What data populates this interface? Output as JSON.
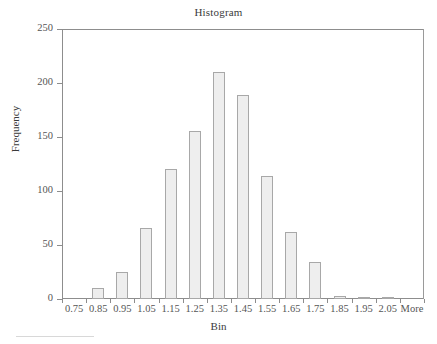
{
  "chart_data": {
    "type": "bar",
    "title": "Histogram",
    "subtitle": "",
    "xlabel": "Bin",
    "ylabel": "Frequency",
    "categories": [
      "0.75",
      "0.85",
      "0.95",
      "1.05",
      "1.15",
      "1.25",
      "1.35",
      "1.45",
      "1.55",
      "1.65",
      "1.75",
      "1.85",
      "1.95",
      "2.05",
      "More"
    ],
    "values": [
      0,
      10,
      25,
      66,
      120,
      156,
      210,
      189,
      114,
      62,
      34,
      3,
      1,
      1,
      0
    ],
    "series": [
      {
        "name": "Frequency",
        "values": [
          0,
          10,
          25,
          66,
          120,
          156,
          210,
          189,
          114,
          62,
          34,
          3,
          1,
          1,
          0
        ]
      }
    ],
    "ylim": [
      0,
      250
    ],
    "y_ticks": [
      0,
      50,
      100,
      150,
      200,
      250
    ],
    "y_tick_labels": [
      "0",
      "50",
      "100",
      "150",
      "200",
      "250"
    ],
    "grid": false,
    "legend": "none",
    "bar_fill_color": "#eeeeee",
    "bar_border_color": "#a8a8a8",
    "axis_color": "#8d8d8d",
    "text_color": "#3b3b3b",
    "plot_background": "#ffffff"
  }
}
